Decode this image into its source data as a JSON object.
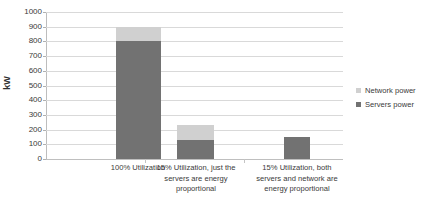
{
  "chart_data": {
    "type": "bar",
    "subtype": "stacked-column",
    "title": "",
    "xlabel": "",
    "ylabel": "kW",
    "ylim": [
      0,
      1000
    ],
    "ytick_step": 100,
    "yticks": [
      1000,
      900,
      800,
      700,
      600,
      500,
      400,
      300,
      200,
      100,
      0
    ],
    "grid": true,
    "legend_position": "right",
    "categories": [
      "100% Utilization",
      "15% Utilization, just the servers are energy proportional",
      "15% Utilization, both servers and network are energy proportional"
    ],
    "category_lines": [
      [
        "100% Utilization"
      ],
      [
        "15% Utilization, just the",
        "servers are energy",
        "proportional"
      ],
      [
        "15% Utilization, both",
        "servers and network are",
        "energy proportional"
      ]
    ],
    "series": [
      {
        "name": "Servers power",
        "color": "#727272",
        "values": [
          800,
          130,
          150
        ]
      },
      {
        "name": "Network power",
        "color": "#d0d0d0",
        "values": [
          100,
          100,
          0
        ]
      }
    ],
    "totals": [
      900,
      230,
      150
    ]
  },
  "axis": {
    "y_title": "kW",
    "tick_labels": [
      "1000",
      "900",
      "800",
      "700",
      "600",
      "500",
      "400",
      "300",
      "200",
      "100",
      "0"
    ]
  },
  "legend": {
    "items": [
      {
        "label": "Network power",
        "color": "#d0d0d0"
      },
      {
        "label": "Servers power",
        "color": "#727272"
      }
    ]
  },
  "colors": {
    "servers_power": "#727272",
    "network_power": "#d0d0d0",
    "gridline": "#d9d9d9",
    "axis_line": "#bdbdbd",
    "text": "#3a3a3a",
    "background": "#ffffff"
  }
}
